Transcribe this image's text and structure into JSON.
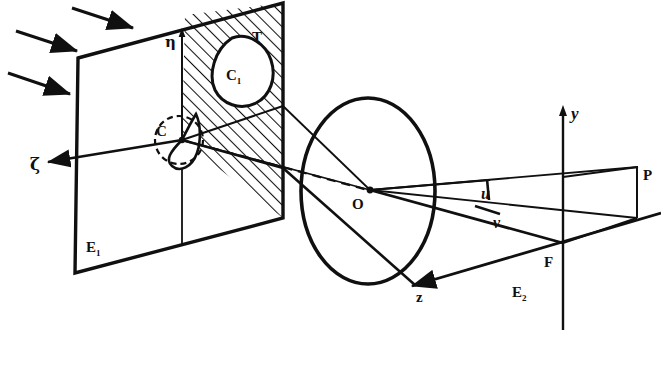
{
  "figure": {
    "kind": "optical-ray-diagram",
    "background_color": "#ffffff",
    "ink_color": "#101010",
    "width": 661,
    "height": 369
  },
  "labels": {
    "plane_object": "E",
    "plane_object_sub": "1",
    "plane_image": "E",
    "plane_image_sub": "2",
    "axis_zeta": "ζ",
    "axis_eta": "η",
    "axis_z": "z",
    "axis_y": "y",
    "region_T": "T",
    "curve_C1": "C",
    "curve_C1_sub": "1",
    "curve_C": "C",
    "lens_center": "O",
    "focus_point": "F",
    "image_point": "P",
    "angle_u": "u",
    "angle_v": "v"
  },
  "elements": {
    "incoming_rays": {
      "name": "incident-light-rays",
      "count": 3,
      "direction": "down-right"
    },
    "object_plane": {
      "name": "object-plane-E1",
      "hatched_region_label": "T",
      "hatching": "diagonal-lines"
    },
    "lens": {
      "name": "lens-ellipse",
      "center_label": "O"
    },
    "image_plane": {
      "name": "image-plane-E2",
      "focus_label": "F",
      "point_label": "P"
    },
    "optical_axis": {
      "name": "optical-axis",
      "style": "dashed"
    }
  }
}
